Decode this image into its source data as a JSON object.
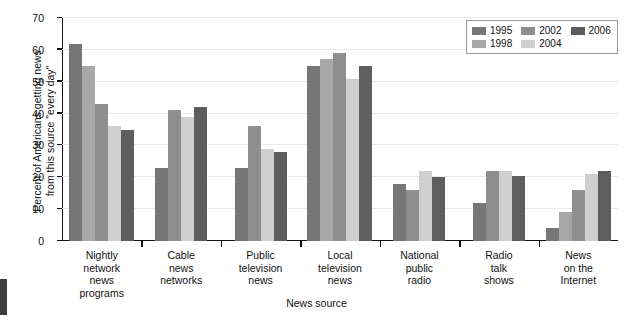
{
  "chart_data": {
    "type": "bar",
    "title": "",
    "xlabel": "News source",
    "ylabel": "Percent of Americans getting news\nfrom this source \"every day\"",
    "ylim": [
      0,
      70
    ],
    "ytick_labels": [
      "0",
      "10",
      "20",
      "30",
      "40",
      "50",
      "60",
      "70"
    ],
    "ytick_values": [
      0,
      10,
      20,
      30,
      40,
      50,
      60,
      70
    ],
    "grid": true,
    "legend_position": "top-right",
    "categories": [
      "Nightly\nnetwork\nnews\nprograms",
      "Cable\nnews\nnetworks",
      "Public\ntelevision\nnews",
      "Local\ntelevision\nnews",
      "National\npublic\nradio",
      "Radio\ntalk\nshows",
      "News\non the\nInternet"
    ],
    "series": [
      {
        "name": "1995",
        "color": "#767676",
        "values": [
          62,
          23,
          23,
          55,
          18,
          12,
          4
        ]
      },
      {
        "name": "1998",
        "color": "#a8a8a8",
        "values": [
          55,
          null,
          null,
          57,
          null,
          null,
          9
        ]
      },
      {
        "name": "2002",
        "color": "#8e8e8e",
        "values": [
          43,
          41,
          36,
          59,
          16,
          22,
          16
        ]
      },
      {
        "name": "2004",
        "color": "#cfcfcf",
        "values": [
          36,
          39,
          29,
          51,
          22,
          22,
          21
        ]
      },
      {
        "name": "2006",
        "color": "#5e5e5e",
        "values": [
          35,
          42,
          28,
          55,
          20,
          20.5,
          22
        ]
      }
    ]
  },
  "legend": {
    "entries": [
      {
        "label": "1995",
        "color": "#767676"
      },
      {
        "label": "2002",
        "color": "#8e8e8e"
      },
      {
        "label": "2006",
        "color": "#5e5e5e"
      },
      {
        "label": "1998",
        "color": "#a8a8a8"
      },
      {
        "label": "2004",
        "color": "#cfcfcf"
      }
    ]
  }
}
